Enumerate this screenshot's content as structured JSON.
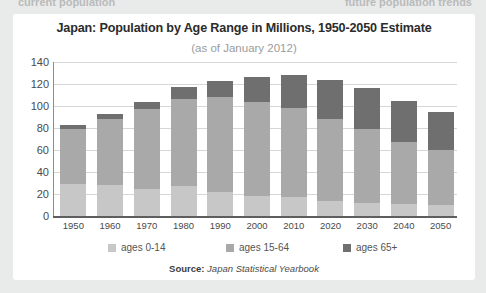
{
  "page": {
    "top_left_fragment": "current population",
    "top_right_fragment": "future population trends"
  },
  "card": {
    "title": "Japan: Population by Age Range in Millions, 1950-2050 Estimate",
    "subtitle": "(as of January 2012)",
    "source_label": "Source:",
    "source_value": "Japan Statistical Yearbook"
  },
  "colors": {
    "ages_0_14": "#c7c7c7",
    "ages_15_64": "#a9a9a9",
    "ages_65_plus": "#6f6f6f",
    "gridline": "#d6d6d6",
    "axis": "#5e5e5e",
    "card_background": "#ffffff",
    "page_background": "#e9eaea"
  },
  "chart_data": {
    "type": "bar",
    "stacked": true,
    "title": "Japan: Population by Age Range in Millions, 1950-2050 Estimate",
    "subtitle": "(as of January 2012)",
    "xlabel": "",
    "ylabel": "",
    "ylim": [
      0,
      140
    ],
    "yticks": [
      0,
      20,
      40,
      60,
      80,
      100,
      120,
      140
    ],
    "grid": true,
    "legend_position": "bottom",
    "categories": [
      "1950",
      "1960",
      "1970",
      "1980",
      "1990",
      "2000",
      "2010",
      "2020",
      "2030",
      "2040",
      "2050"
    ],
    "series": [
      {
        "name": "ages 0-14",
        "color": "#c7c7c7",
        "values": [
          29,
          28,
          25,
          27,
          22,
          18,
          17,
          14,
          12,
          11,
          10
        ]
      },
      {
        "name": "ages 15-64",
        "color": "#a9a9a9",
        "values": [
          50,
          60,
          72,
          79,
          86,
          86,
          81,
          74,
          67,
          56,
          50
        ]
      },
      {
        "name": "ages 65+",
        "color": "#6f6f6f",
        "values": [
          4,
          5,
          7,
          11,
          15,
          22,
          30,
          36,
          37,
          38,
          35
        ]
      }
    ],
    "totals": [
      83,
      93,
      104,
      117,
      123,
      126,
      128,
      124,
      116,
      105,
      95
    ]
  }
}
